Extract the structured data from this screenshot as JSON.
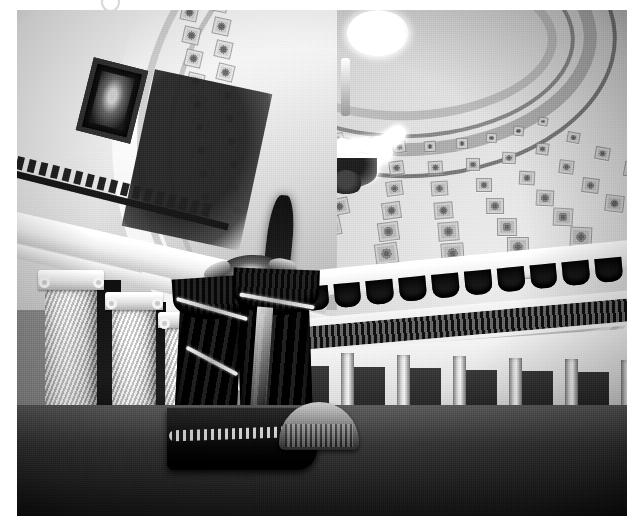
{
  "page": {
    "background_color": "#ffffff",
    "width": 641,
    "height": 530
  },
  "artifact": {
    "name": "scan-artifact",
    "shape": "circle",
    "color": "#c9c9c9"
  },
  "photograph": {
    "medium": "black-and-white photograph",
    "subject": "Old Senate Chamber interior, United States Capitol",
    "frame": {
      "x": 17,
      "y": 10,
      "width": 610,
      "height": 506
    },
    "palette": {
      "highlight": "#fbfaf7",
      "light_plaster": "#e8e4dc",
      "mid_gray": "#b5afa3",
      "shadow": "#4a443a",
      "deep_shadow": "#15120e"
    },
    "regions": {
      "dome": {
        "label": "half-dome ceiling",
        "description": "coffered half dome with recessed square panels in receding rows",
        "coffer_rows": 9,
        "coffers_per_row": 9,
        "decorative_rings": 4
      },
      "oculi": {
        "label": "skylights",
        "count": 2,
        "description": "two bright circular oculus openings near the crown of the dome"
      },
      "chandelier": {
        "label": "crystal chandelier",
        "description": "large ornate gas chandelier suspended on a stem from the dome crown",
        "arm_count": 12,
        "tiers": 3
      },
      "gallery": {
        "label": "visitors gallery",
        "description": "curved balcony with cast-iron balustrade and dark draped valances",
        "valance_count": 12
      },
      "colonnade_left": {
        "label": "mottled marble columns",
        "description": "Ionic columns of variegated breccia marble supporting the entablature",
        "column_count": 3
      },
      "colonnade_lower": {
        "label": "lower colonnade",
        "description": "row of slender columns and dark doorways beneath the gallery",
        "column_count": 7
      },
      "entablature": {
        "label": "entablature and dentil cornice",
        "description": "classical cornice band with dentil blocks running above the left colonnade"
      },
      "portrait": {
        "label": "framed portrait",
        "description": "dark framed oil portrait hung high on the left wall"
      },
      "drapery": {
        "label": "drapery and flags",
        "description": "heavy dark swagged curtains with tasseled cords and an eagle ornament above the presiding officer's chair"
      },
      "rostrum": {
        "label": "presiding officer's rostrum",
        "description": "raised dais with balustraded rail at the front of the chamber"
      },
      "secretary_desk": {
        "label": "secretary's desk",
        "description": "curved light-toned desk directly below the rostrum"
      },
      "desks": {
        "label": "senators' desks",
        "description": "concentric semicircular rows of mahogany desks with high-backed chairs",
        "row_count": 4,
        "approximate_desk_count": 48
      },
      "floor": {
        "label": "chamber floor",
        "description": "dark carpeted floor in the foreground"
      }
    }
  }
}
